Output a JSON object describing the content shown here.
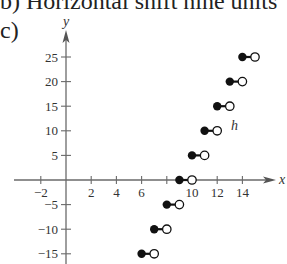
{
  "caption": "b)  Horizontal shift nine units",
  "part_label": "c)",
  "chart_data": {
    "type": "scatter",
    "title": "",
    "subtitle": "",
    "function_label": "h",
    "xlabel": "x",
    "ylabel": "y",
    "xlim": [
      -2.5,
      16
    ],
    "ylim": [
      -17,
      30
    ],
    "grid": false,
    "legend": "none",
    "x_ticks": [
      -2,
      2,
      4,
      6,
      8,
      10,
      12,
      14
    ],
    "x_tick_labels": [
      "−2",
      "2",
      "4",
      "6",
      "",
      "10",
      "12",
      "14"
    ],
    "y_ticks": [
      25,
      20,
      15,
      10,
      5,
      -5,
      -10,
      -15
    ],
    "y_tick_labels": [
      "25",
      "20",
      "15",
      "10",
      "5",
      "−5",
      "−10",
      "−15"
    ],
    "series": [
      {
        "name": "h",
        "steps": [
          {
            "x_start": 6,
            "x_end": 7,
            "y": -15
          },
          {
            "x_start": 7,
            "x_end": 8,
            "y": -10
          },
          {
            "x_start": 8,
            "x_end": 9,
            "y": -5
          },
          {
            "x_start": 9,
            "x_end": 10,
            "y": 0
          },
          {
            "x_start": 10,
            "x_end": 11,
            "y": 5
          },
          {
            "x_start": 11,
            "x_end": 12,
            "y": 10
          },
          {
            "x_start": 12,
            "x_end": 13,
            "y": 15
          },
          {
            "x_start": 13,
            "x_end": 14,
            "y": 20
          },
          {
            "x_start": 14,
            "x_end": 15,
            "y": 25
          }
        ],
        "closed_points": {
          "x": [
            6,
            7,
            8,
            9,
            10,
            11,
            12,
            13,
            14
          ],
          "y": [
            -15,
            -10,
            -5,
            0,
            5,
            10,
            15,
            20,
            25
          ]
        },
        "open_points": {
          "x": [
            7,
            8,
            9,
            10,
            11,
            12,
            13,
            14,
            15
          ],
          "y": [
            -15,
            -10,
            -5,
            0,
            5,
            10,
            15,
            20,
            25
          ]
        }
      }
    ],
    "annotations": [
      {
        "text": "h",
        "x": 13.5,
        "y": 11
      }
    ]
  }
}
